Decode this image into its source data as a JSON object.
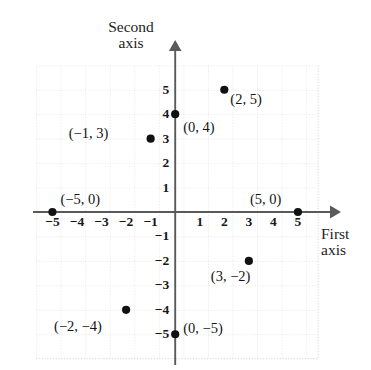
{
  "figure": {
    "type": "scatter-coordinate-plane",
    "background_color": "#ffffff",
    "axis_color": "#555555",
    "grid_color": "#d8d8d8",
    "point_color": "#111111"
  },
  "axes": {
    "x_axis_name": "First\naxis",
    "x_axis_name_line1": "First",
    "x_axis_name_line2": "axis",
    "y_axis_name_line1": "Second",
    "y_axis_name_line2": "axis",
    "x_ticks": [
      "−5",
      "−4",
      "−3",
      "−2",
      "−1",
      "1",
      "2",
      "3",
      "4",
      "5"
    ],
    "x_tick_values": [
      -5,
      -4,
      -3,
      -2,
      -1,
      1,
      2,
      3,
      4,
      5
    ],
    "y_ticks": [
      "5",
      "4",
      "3",
      "2",
      "1",
      "−1",
      "−2",
      "−3",
      "−4",
      "−5"
    ],
    "y_tick_values": [
      5,
      4,
      3,
      2,
      1,
      -1,
      -2,
      -3,
      -4,
      -5
    ],
    "xlim": [
      -5.7,
      5.8
    ],
    "ylim": [
      -5.9,
      6.0
    ],
    "grid": true,
    "grid_style": "dotted"
  },
  "chart_data": {
    "type": "scatter",
    "title": "",
    "xlabel": "First axis",
    "ylabel": "Second axis",
    "xlim": [
      -5.7,
      5.8
    ],
    "ylim": [
      -5.9,
      6.0
    ],
    "grid": true,
    "legend": "none",
    "points": [
      {
        "label": "(2, 5)",
        "x": 2,
        "y": 5,
        "label_dx": 6,
        "label_dy": 10
      },
      {
        "label": "(0, 4)",
        "x": 0,
        "y": 4,
        "label_dx": 8,
        "label_dy": 14
      },
      {
        "label": "(−1, 3)",
        "x": -1,
        "y": 3,
        "label_dx": -82,
        "label_dy": -5
      },
      {
        "label": "(−5, 0)",
        "x": -5,
        "y": 0,
        "label_dx": 8,
        "label_dy": -12
      },
      {
        "label": "(5, 0)",
        "x": 5,
        "y": 0,
        "label_dx": -48,
        "label_dy": -12
      },
      {
        "label": "(3, −2)",
        "x": 3,
        "y": -2,
        "label_dx": -38,
        "label_dy": 16
      },
      {
        "label": "(−2, −4)",
        "x": -2,
        "y": -4,
        "label_dx": -72,
        "label_dy": 17
      },
      {
        "label": "(0, −5)",
        "x": 0,
        "y": -5,
        "label_dx": 8,
        "label_dy": -5
      }
    ]
  }
}
